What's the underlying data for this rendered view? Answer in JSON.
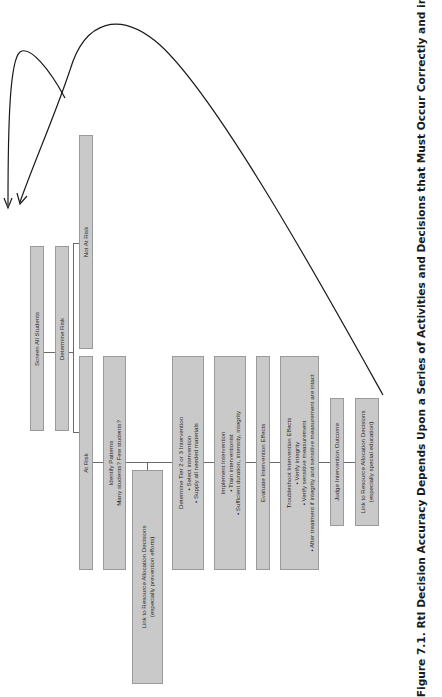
{
  "figure": {
    "caption": "Figure 7.1.  RtI Decision Accuracy Depends Upon a Series of Activities and Decisions that Must Occur Correctly and in",
    "box_fill": "#c9c9c9",
    "box_border": "#9a9a9a",
    "line_color": "#6a6a6a"
  },
  "boxes": {
    "screen": {
      "lines": [
        "Screen All Students"
      ]
    },
    "determine_risk": {
      "lines": [
        "Determine Risk"
      ]
    },
    "not_at_risk": {
      "lines": [
        "Not At Risk"
      ]
    },
    "at_risk": {
      "lines": [
        "At Risk"
      ]
    },
    "identify": {
      "lines": [
        "Identify Patterns",
        "Many students? Few students?"
      ]
    },
    "link_prevention": {
      "lines": [
        "Link to Resource Allocation Decisions",
        "(especially prevention efforts)"
      ]
    },
    "determine_tier": {
      "lines": [
        "Determine Tier 2 or 3 Intervention",
        "• Select intervention",
        "• Supply all needed materials"
      ]
    },
    "implement": {
      "lines": [
        "Implement Intervention",
        "• Train interventionist",
        "• Sufficient duration, intensity, integrity"
      ]
    },
    "evaluate": {
      "lines": [
        "Evaluate Intervention Effects"
      ]
    },
    "troubleshoot": {
      "lines": [
        "Troubleshoot Intervention Effects",
        "• Verify integrity",
        "• Verify sensitive measurement",
        "• After treatment if integrity and sensitive measurement are intact"
      ]
    },
    "judge": {
      "lines": [
        "Judge Intervention Outcome"
      ]
    },
    "link_special": {
      "lines": [
        "Link to Resource Allocation Decisions",
        "(especially special education)"
      ]
    }
  },
  "annotations": {
    "arrows": [
      "curved-arrow-short",
      "curved-arrow-long"
    ]
  }
}
